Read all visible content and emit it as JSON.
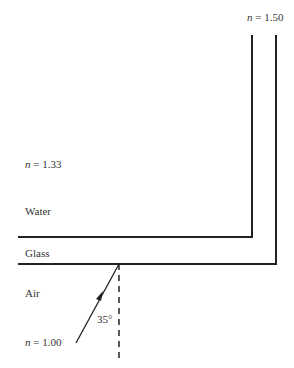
{
  "diagram": {
    "type": "refraction-diagram",
    "labels": {
      "glass_index": "n = 1.50",
      "water_index": "n = 1.33",
      "water": "Water",
      "glass": "Glass",
      "air": "Air",
      "air_index": "n = 1.00",
      "angle": "35°"
    },
    "index_parts": {
      "glass": {
        "var": "n",
        "rest": " = 1.50"
      },
      "water": {
        "var": "n",
        "rest": " = 1.33"
      },
      "air": {
        "var": "n",
        "rest": " = 1.00"
      }
    },
    "media": [
      "Air",
      "Glass",
      "Water"
    ],
    "refractive_indices": {
      "Air": 1.0,
      "Glass": 1.5,
      "Water": 1.33
    },
    "incident_angle_deg": 35,
    "colors": {
      "line": "#222222",
      "text": "#333333",
      "background": "#ffffff"
    }
  }
}
